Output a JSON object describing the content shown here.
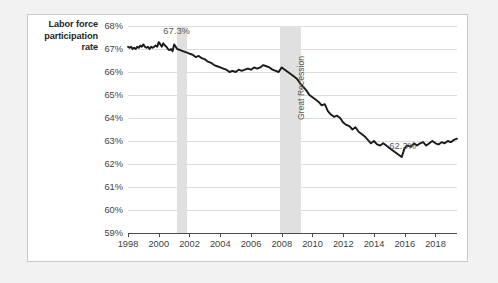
{
  "chart_data": {
    "type": "line",
    "title": "",
    "ylabel": "Labor force participation rate",
    "xlabel": "",
    "ylim": [
      59,
      68
    ],
    "xlim": [
      1998,
      2019.4
    ],
    "grid": true,
    "legend": false,
    "yticks": [
      "59%",
      "60%",
      "61%",
      "62%",
      "63%",
      "64%",
      "65%",
      "66%",
      "67%",
      "68%"
    ],
    "ytick_values": [
      59,
      60,
      61,
      62,
      63,
      64,
      65,
      66,
      67,
      68
    ],
    "xticks": [
      "1998",
      "2000",
      "2002",
      "2004",
      "2006",
      "2008",
      "2010",
      "2012",
      "2014",
      "2016",
      "2018"
    ],
    "xtick_values": [
      1998,
      2000,
      2002,
      2004,
      2006,
      2008,
      2010,
      2012,
      2014,
      2016,
      2018
    ],
    "line_color": "#1a1a1a",
    "band_color": "#e0e0e0",
    "annotations": [
      {
        "text": "67.3%",
        "x": 2000.3,
        "y": 67.55
      },
      {
        "text": "62.3%",
        "x": 2015.0,
        "y": 62.55
      },
      {
        "text": "Great Recession",
        "x": 2008.9,
        "y": 63.9,
        "rotated": true
      }
    ],
    "shaded_regions": [
      {
        "label": "2001 recession",
        "x_start": 2001.2,
        "x_end": 2001.85
      },
      {
        "label": "Great Recession",
        "x_start": 2007.9,
        "x_end": 2009.25
      }
    ],
    "series": [
      {
        "name": "Labor force participation rate",
        "x": [
          1998.0,
          1998.1,
          1998.2,
          1998.3,
          1998.4,
          1998.5,
          1998.6,
          1998.7,
          1998.8,
          1998.9,
          1999.0,
          1999.1,
          1999.2,
          1999.3,
          1999.4,
          1999.5,
          1999.6,
          1999.7,
          1999.8,
          1999.9,
          2000.0,
          2000.1,
          2000.2,
          2000.3,
          2000.4,
          2000.5,
          2000.6,
          2000.7,
          2000.8,
          2000.9,
          2001.0,
          2001.2,
          2001.4,
          2001.6,
          2001.8,
          2002.0,
          2002.2,
          2002.4,
          2002.6,
          2002.8,
          2003.0,
          2003.2,
          2003.4,
          2003.6,
          2003.8,
          2004.0,
          2004.2,
          2004.4,
          2004.6,
          2004.8,
          2005.0,
          2005.2,
          2005.4,
          2005.6,
          2005.8,
          2006.0,
          2006.2,
          2006.4,
          2006.6,
          2006.8,
          2007.0,
          2007.2,
          2007.4,
          2007.6,
          2007.8,
          2008.0,
          2008.2,
          2008.4,
          2008.6,
          2008.8,
          2009.0,
          2009.2,
          2009.4,
          2009.6,
          2009.8,
          2010.0,
          2010.2,
          2010.4,
          2010.6,
          2010.8,
          2011.0,
          2011.2,
          2011.4,
          2011.6,
          2011.8,
          2012.0,
          2012.2,
          2012.4,
          2012.6,
          2012.8,
          2013.0,
          2013.2,
          2013.4,
          2013.6,
          2013.8,
          2014.0,
          2014.2,
          2014.4,
          2014.6,
          2014.8,
          2015.0,
          2015.2,
          2015.4,
          2015.6,
          2015.8,
          2016.0,
          2016.2,
          2016.4,
          2016.6,
          2016.8,
          2017.0,
          2017.2,
          2017.4,
          2017.6,
          2017.8,
          2018.0,
          2018.2,
          2018.4,
          2018.6,
          2018.8,
          2019.0,
          2019.2,
          2019.4
        ],
        "y": [
          67.1,
          67.05,
          67.1,
          67.0,
          67.05,
          67.0,
          67.1,
          67.05,
          67.15,
          67.1,
          67.2,
          67.1,
          67.05,
          67.1,
          67.0,
          67.1,
          67.05,
          67.1,
          67.15,
          67.1,
          67.3,
          67.2,
          67.1,
          67.25,
          67.15,
          67.1,
          67.0,
          66.95,
          67.0,
          66.9,
          67.2,
          67.0,
          66.95,
          66.9,
          66.85,
          66.8,
          66.75,
          66.65,
          66.7,
          66.6,
          66.55,
          66.45,
          66.4,
          66.3,
          66.25,
          66.2,
          66.15,
          66.1,
          66.0,
          66.05,
          66.0,
          66.1,
          66.05,
          66.1,
          66.15,
          66.1,
          66.2,
          66.15,
          66.2,
          66.3,
          66.25,
          66.2,
          66.1,
          66.05,
          66.0,
          66.2,
          66.1,
          66.0,
          65.9,
          65.8,
          65.7,
          65.5,
          65.35,
          65.2,
          65.0,
          64.9,
          64.8,
          64.7,
          64.55,
          64.6,
          64.3,
          64.15,
          64.05,
          64.1,
          64.0,
          63.8,
          63.7,
          63.65,
          63.5,
          63.6,
          63.4,
          63.3,
          63.2,
          63.05,
          62.9,
          63.0,
          62.85,
          62.8,
          62.9,
          62.8,
          62.7,
          62.6,
          62.5,
          62.4,
          62.3,
          62.7,
          62.8,
          62.75,
          62.9,
          62.8,
          62.9,
          62.95,
          62.8,
          62.9,
          63.0,
          62.9,
          62.85,
          62.95,
          62.9,
          63.0,
          62.95,
          63.05,
          63.1
        ]
      }
    ]
  },
  "axis_title": {
    "line1": "Labor force",
    "line2": "participation",
    "line3": "rate"
  }
}
